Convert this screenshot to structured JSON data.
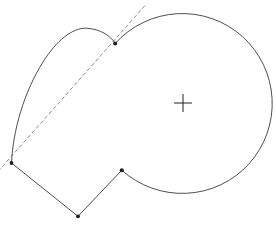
{
  "figure": {
    "background_color": "#ffffff",
    "stroke_color": "#3a3a40",
    "dashed_stroke_color": "#6b6b72",
    "marker_color": "#1d1d20",
    "canvas": {
      "width": 276,
      "height": 228
    },
    "circle": {
      "name": "base-circle",
      "center_x": 183,
      "center_y": 103,
      "radius": 90,
      "arc_path": "M 115.2 43.4 A 90 90 0 1 1 121.8 170.2",
      "center_marker": {
        "name": "center-cross",
        "glyph": "+",
        "arm_length": 9
      }
    },
    "spiral_lobe": {
      "name": "involute-lobe",
      "path": "M 11.5 163.0 C 12.8 131.0 24.0 92.0 43.0 62.0 C 56.0 41.0 72.5 27.5 86.5 28.2 C 100.0 29.0 110.5 35.5 115.2 43.4",
      "start_x": 11.5,
      "start_y": 163.0,
      "apex_x": 86.5,
      "apex_y": 28.2,
      "end_x": 115.2,
      "end_y": 43.4
    },
    "tangent_line": {
      "name": "tangent-dashed-line",
      "style": "dashed",
      "x1": -2.0,
      "y1": 171.5,
      "x2": 145.5,
      "y2": 5.0
    },
    "polygon": {
      "name": "chord-polygon",
      "points": "11.5,163.0 78.0,216.3 121.8,170.2",
      "vertices": [
        {
          "name": "cusp-left-vertex",
          "x": 11.5,
          "y": 163.0
        },
        {
          "name": "bottom-vertex",
          "x": 78.0,
          "y": 216.3
        },
        {
          "name": "right-vertex",
          "x": 121.8,
          "y": 170.2
        }
      ]
    },
    "markers": [
      {
        "name": "marker-left-cusp",
        "x": 11.5,
        "y": 163.0,
        "r": 1.9
      },
      {
        "name": "marker-top-cusp",
        "x": 115.2,
        "y": 43.4,
        "r": 2.0
      },
      {
        "name": "marker-bottom-vertex",
        "x": 78.0,
        "y": 216.3,
        "r": 1.9
      },
      {
        "name": "marker-right-vertex",
        "x": 121.8,
        "y": 170.2,
        "r": 2.0
      }
    ]
  }
}
